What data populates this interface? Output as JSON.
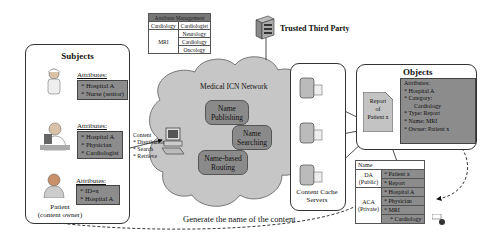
{
  "subjects": {
    "title": "Subjects",
    "nurse": {
      "attr_label": "Attributes:",
      "attrs": [
        "* Hospital A",
        "* Nurse (senior)"
      ]
    },
    "physician": {
      "attr_label": "Attributes:",
      "attrs": [
        "* Hospital A",
        "* Physician",
        "* Cardiologist"
      ]
    },
    "patient": {
      "attr_label": "Attributes:",
      "attrs": [
        "* ID=x",
        "* Hospital A"
      ],
      "caption_line1": "Patient",
      "caption_line2": "(content owner)"
    }
  },
  "attribute_management": {
    "header": "Attribute Management",
    "rows": [
      {
        "key": "Cardiology",
        "values": [
          "Cardiologist"
        ]
      },
      {
        "key": "MRI",
        "values": [
          "Neurology",
          "Cardiology",
          "Oncology"
        ]
      }
    ]
  },
  "ttp": {
    "label": "Trusted Third Party"
  },
  "network": {
    "title": "Medical ICN Network",
    "functions": [
      "Name Publishing",
      "Name Searching",
      "Name-based Routing"
    ]
  },
  "client": {
    "lines": [
      "Content",
      "* Distribution",
      "* Search",
      "* Retrieve"
    ]
  },
  "cache": {
    "label_line1": "Content Cache",
    "label_line2": "Servers"
  },
  "objects": {
    "title": "Objects",
    "report": [
      "Report",
      "of",
      "Patient x"
    ],
    "attr_label": "Attributes:",
    "attrs": [
      "* Hospital A",
      "* Category:",
      "  Cardiology",
      "* Type: Report",
      "* Name: MRI",
      "* Owner: Patient x"
    ]
  },
  "name_table": {
    "header": "Name",
    "da_label": [
      "DA",
      "(Public)"
    ],
    "da_values": [
      "* Patient x",
      "* Report"
    ],
    "aca_label": [
      "ACA",
      "(Private)"
    ],
    "aca_values": [
      "* Hospital A",
      "* Physician",
      "* MRI",
      "* Cardiology"
    ]
  },
  "footer_label": "Generate the name of the content",
  "colors": {
    "fill_gray": "#8c8c8c",
    "cloud": "#c8c8c8",
    "border": "#333333"
  }
}
